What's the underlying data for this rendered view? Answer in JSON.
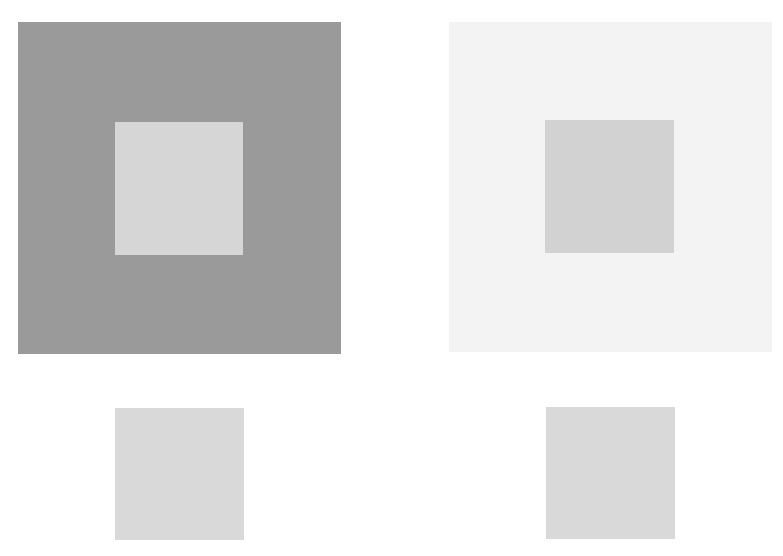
{
  "colors": {
    "background": "#ffffff",
    "dark_surround": "#9a9a9a",
    "light_surround": "#f3f3f3",
    "target_gray": "#d4d4d4"
  },
  "panels": [
    {
      "name": "dark-surround",
      "surround_color": "#9a9a9a",
      "inner_color": "#d4d4d4"
    },
    {
      "name": "light-surround",
      "surround_color": "#f3f3f3",
      "inner_color": "#d4d4d4"
    }
  ],
  "reference_swatches": [
    {
      "name": "left-reference",
      "color": "#d4d4d4"
    },
    {
      "name": "right-reference",
      "color": "#d4d4d4"
    }
  ]
}
